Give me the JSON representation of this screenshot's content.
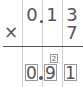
{
  "problem": {
    "multiplicand_digits": [
      "0",
      "1",
      "3"
    ],
    "multiplier_digits": [
      "7"
    ],
    "operator": "×",
    "carry": "2",
    "answer_digits": [
      "0",
      "9",
      "1"
    ]
  }
}
